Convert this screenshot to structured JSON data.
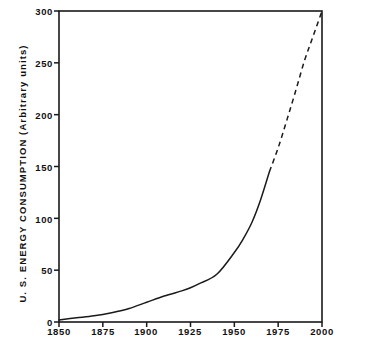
{
  "chart_data": {
    "type": "line",
    "title": "",
    "xlabel": "",
    "ylabel": "U. S.  ENERGY  CONSUMPTION  (Arbitrary units)",
    "xlim": [
      1850,
      2000
    ],
    "ylim": [
      0,
      300
    ],
    "xticks": [
      1850,
      1875,
      1900,
      1925,
      1950,
      1975,
      2000
    ],
    "yticks": [
      0,
      50,
      100,
      150,
      200,
      250,
      300
    ],
    "grid": false,
    "legend": null,
    "series": [
      {
        "name": "Historical energy consumption",
        "style": "solid",
        "x": [
          1850,
          1860,
          1870,
          1880,
          1890,
          1900,
          1910,
          1920,
          1925,
          1930,
          1940,
          1950,
          1955,
          1960,
          1965,
          1970
        ],
        "values": [
          2,
          4,
          6,
          9,
          13,
          19,
          25,
          30,
          33,
          37,
          46,
          67,
          80,
          96,
          118,
          145
        ]
      },
      {
        "name": "Projected energy consumption",
        "style": "dashed",
        "x": [
          1970,
          1975,
          1980,
          1985,
          1990,
          1995,
          2000
        ],
        "values": [
          145,
          168,
          195,
          223,
          252,
          276,
          300
        ]
      }
    ],
    "annotations": []
  },
  "axis": {
    "y_tick_labels": [
      "300",
      "250",
      "200",
      "150",
      "100",
      "50",
      "0"
    ],
    "x_tick_labels": [
      "1850",
      "1875",
      "1900",
      "1925",
      "1950",
      "1975",
      "2000"
    ],
    "y_axis_title": "U. S.  ENERGY  CONSUMPTION  (Arbitrary units)"
  },
  "colors": {
    "line": "#1a1a1a",
    "frame": "#1a1a1a",
    "background": "#ffffff",
    "text": "#111111"
  }
}
